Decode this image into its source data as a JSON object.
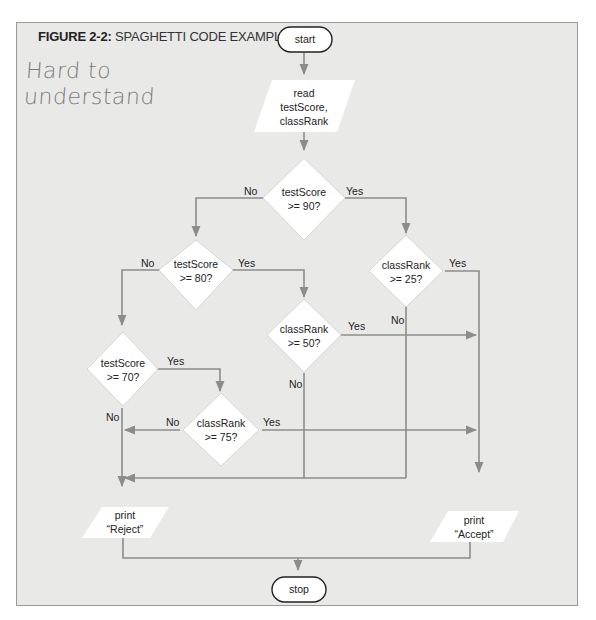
{
  "figure": {
    "number": "FIGURE 2-2:",
    "title": "SPAGHETTI CODE EXAMPLE",
    "handwritten_note": [
      "Hard to",
      "understand"
    ]
  },
  "flowchart": {
    "start": "start",
    "read": [
      "read",
      "testScore,",
      "classRank"
    ],
    "d_ts90": [
      "testScore",
      ">= 90?"
    ],
    "d_ts80": [
      "testScore",
      ">= 80?"
    ],
    "d_cr25": [
      "classRank",
      ">= 25?"
    ],
    "d_cr50": [
      "classRank",
      ">= 50?"
    ],
    "d_ts70": [
      "testScore",
      ">= 70?"
    ],
    "d_cr75": [
      "classRank",
      ">= 75?"
    ],
    "print_reject": [
      "print",
      "“Reject”"
    ],
    "print_accept": [
      "print",
      "“Accept”"
    ],
    "stop": "stop",
    "labels": {
      "yes": "Yes",
      "no": "No"
    }
  },
  "colors": {
    "background": "#e9e9e8",
    "line": "#8c8c8c",
    "shape_fill": "#ffffff",
    "terminal_stroke": "#222222"
  }
}
